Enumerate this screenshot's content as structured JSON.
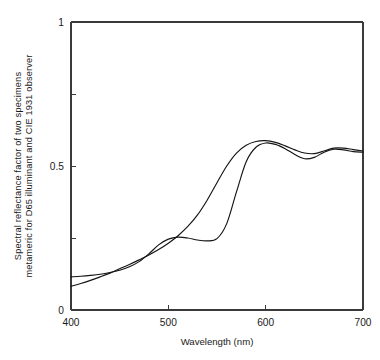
{
  "chart_data": {
    "type": "line",
    "title": "",
    "xlabel": "Wavelength (nm)",
    "ylabel_line1": "Spectral reflectance factor of two specimens",
    "ylabel_line2": "metameric for D65 illuminant and CIE 1931 observer",
    "xlim": [
      400,
      700
    ],
    "ylim": [
      0,
      1
    ],
    "xticks": [
      400,
      500,
      600,
      700
    ],
    "xtick_labels": [
      "400",
      "500",
      "600",
      "700"
    ],
    "yticks": [
      0,
      0.25,
      0.5,
      0.75,
      1
    ],
    "ytick_labels": [
      "0",
      "",
      "0.5",
      "",
      "1"
    ],
    "grid": false,
    "legend": "none",
    "line_color": "#141414",
    "axis_color": "#3a3a3a",
    "x": [
      400,
      410,
      420,
      430,
      440,
      450,
      460,
      470,
      480,
      490,
      500,
      510,
      520,
      530,
      540,
      550,
      560,
      570,
      580,
      590,
      600,
      610,
      620,
      630,
      640,
      650,
      660,
      670,
      680,
      690,
      700
    ],
    "series": [
      {
        "name": "specimen-1",
        "values": [
          0.115,
          0.117,
          0.12,
          0.124,
          0.13,
          0.138,
          0.15,
          0.168,
          0.195,
          0.226,
          0.246,
          0.253,
          0.25,
          0.243,
          0.24,
          0.248,
          0.3,
          0.41,
          0.515,
          0.565,
          0.58,
          0.575,
          0.56,
          0.54,
          0.525,
          0.53,
          0.548,
          0.558,
          0.556,
          0.55,
          0.548
        ]
      },
      {
        "name": "specimen-2",
        "values": [
          0.082,
          0.092,
          0.103,
          0.115,
          0.128,
          0.143,
          0.158,
          0.174,
          0.191,
          0.21,
          0.232,
          0.258,
          0.29,
          0.33,
          0.382,
          0.442,
          0.5,
          0.545,
          0.572,
          0.585,
          0.588,
          0.582,
          0.57,
          0.556,
          0.545,
          0.543,
          0.552,
          0.562,
          0.562,
          0.557,
          0.552
        ]
      }
    ]
  },
  "axes_geometry": {
    "left": 71,
    "right": 363,
    "top": 22,
    "bottom": 310
  }
}
